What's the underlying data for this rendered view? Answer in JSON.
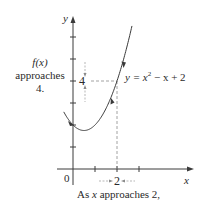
{
  "figure": {
    "y_axis_label": "y",
    "x_axis_label": "x",
    "origin_label": "0",
    "y_tick_value_label": "4",
    "x_tick_value_label": "2",
    "curve_label": {
      "prefix": "y = x",
      "exponent": "2",
      "suffix": " − x + 2"
    },
    "left_annotation": {
      "line1": "f(x)",
      "line2": "approaches",
      "line3": "4."
    },
    "bottom_annotation": {
      "prefix": "As ",
      "var": "x",
      "suffix": " approaches 2,"
    }
  },
  "chart_data": {
    "type": "line",
    "title": "",
    "function": "y = x^2 - x + 2",
    "xlabel": "x",
    "ylabel": "y",
    "x": [
      -0.4,
      0,
      0.5,
      1,
      1.5,
      2,
      2.5,
      3
    ],
    "values": [
      2.56,
      2,
      1.75,
      2,
      2.75,
      4,
      5.75,
      8
    ],
    "highlight_point": {
      "x": 2,
      "y": 4
    },
    "x_ticks": [
      1,
      2,
      3
    ],
    "y_ticks": [
      1,
      2,
      3,
      4,
      5,
      6
    ],
    "labeled_ticks": {
      "x": [
        2
      ],
      "y": [
        4
      ]
    },
    "grid": false,
    "colors": {
      "curve": "#3a3a3a",
      "axes": "#3a3a3a",
      "dashed": "#8a8a8a"
    }
  }
}
